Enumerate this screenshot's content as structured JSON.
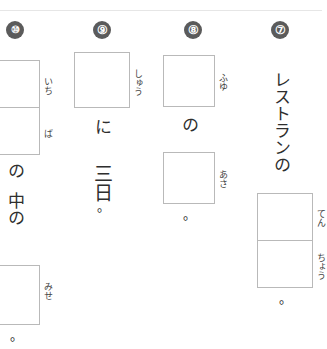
{
  "worksheet": {
    "title": "Japanese kanji fill-in worksheet",
    "writing_mode": "vertical-rtl",
    "rule_color": "#e6e6e6",
    "box_border_color": "#b9b9b9",
    "number_badge_color": "#5b5b5b",
    "ink_color": "#2e2e2e"
  },
  "questions": [
    {
      "number": "⑦",
      "number_plain": "7",
      "lead_text": "レストランの",
      "boxes": [
        {
          "furigana": "てん",
          "answer": ""
        },
        {
          "furigana": "ちょう",
          "answer": ""
        }
      ],
      "terminator": "。"
    },
    {
      "number": "⑧",
      "number_plain": "8",
      "box1_furigana": "ふゆ",
      "middle_text": "の",
      "box2_furigana": "あさ",
      "terminator": "。"
    },
    {
      "number": "⑨",
      "number_plain": "9",
      "box1_furigana": "しゅう",
      "particle": "に",
      "tail_text": "三日",
      "terminator": "。"
    },
    {
      "number": "⑩",
      "number_plain": "10",
      "boxes_top": [
        {
          "furigana": "いち"
        },
        {
          "furigana": "ば"
        }
      ],
      "middle_text_1": "の",
      "middle_text_2": "中の",
      "box_bottom_furigana": "みせ",
      "terminator": "。"
    }
  ]
}
